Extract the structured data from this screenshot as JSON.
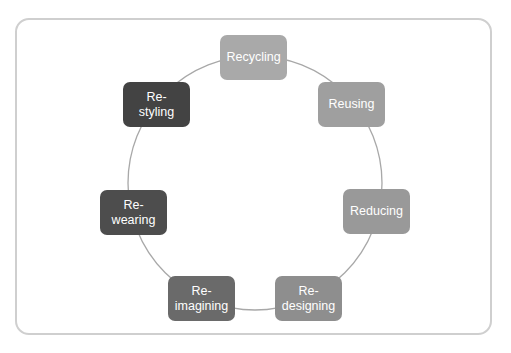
{
  "diagram": {
    "type": "cycle",
    "ring_color": "#a8a8a8",
    "frame_color": "#cfcfcf",
    "nodes": [
      {
        "id": "recycling",
        "label": "Recycling",
        "color": "#a9a9a9",
        "x": 220,
        "y": 35
      },
      {
        "id": "reusing",
        "label": "Reusing",
        "color": "#9f9f9f",
        "x": 318,
        "y": 82
      },
      {
        "id": "reducing",
        "label": "Reducing",
        "color": "#999999",
        "x": 343,
        "y": 189
      },
      {
        "id": "redesigning",
        "label": "Re-\ndesigning",
        "color": "#8e8e8e",
        "x": 275,
        "y": 276
      },
      {
        "id": "reimagining",
        "label": "Re-\nimagining",
        "color": "#6a6a6a",
        "x": 168,
        "y": 276
      },
      {
        "id": "rewearing",
        "label": "Re-\nwearing",
        "color": "#4d4d4d",
        "x": 100,
        "y": 190
      },
      {
        "id": "restyling",
        "label": "Re-\nstyling",
        "color": "#434343",
        "x": 123,
        "y": 82
      }
    ]
  }
}
